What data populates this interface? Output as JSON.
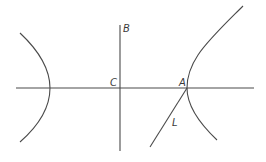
{
  "figure": {
    "type": "geometric-diagram",
    "stroke_color": "#4a4a4a",
    "labels": {
      "B": "B",
      "C": "C",
      "A": "A",
      "L": "L"
    },
    "points": {
      "C": {
        "x": 120,
        "y": 88
      },
      "A": {
        "x": 187,
        "y": 88
      },
      "B_label": {
        "x": 123,
        "y": 32
      },
      "C_label": {
        "x": 110,
        "y": 86
      },
      "A_label": {
        "x": 179,
        "y": 86
      },
      "L_label": {
        "x": 172,
        "y": 126
      }
    },
    "elements": [
      {
        "name": "horizontal-axis",
        "from": [
          16,
          88
        ],
        "to": [
          254,
          88
        ]
      },
      {
        "name": "vertical-axis",
        "from": [
          120,
          25
        ],
        "to": [
          120,
          151
        ]
      },
      {
        "name": "left-branch",
        "top": [
          20,
          33
        ],
        "vertex": [
          50,
          88
        ],
        "bottom": [
          20,
          142
        ]
      },
      {
        "name": "right-branch",
        "top": [
          243,
          6
        ],
        "vertex": [
          187,
          88
        ],
        "bottom": [
          217,
          140
        ]
      },
      {
        "name": "line-L",
        "from": [
          187,
          88
        ],
        "to": [
          150,
          147
        ]
      }
    ]
  }
}
